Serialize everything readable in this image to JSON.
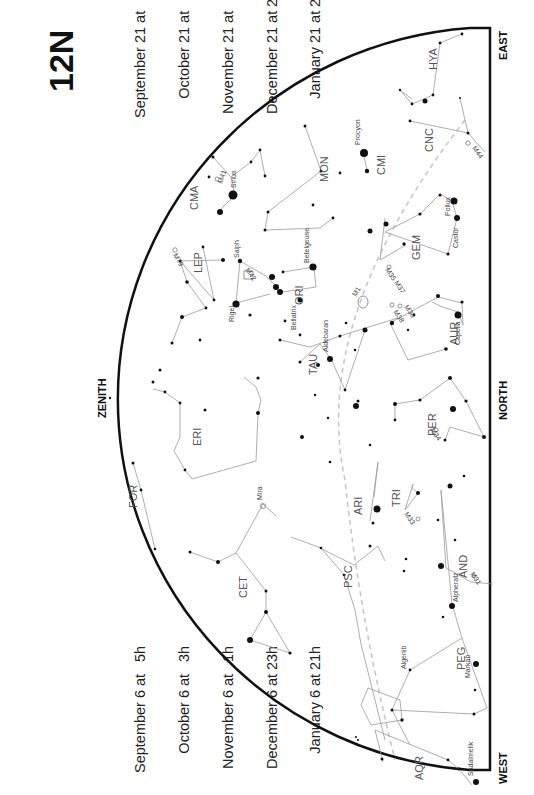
{
  "chart": {
    "id": "12N",
    "directions": {
      "east": "EAST",
      "north": "NORTH",
      "west": "WEST",
      "zenith": "ZENITH"
    }
  },
  "times_top": [
    {
      "date": "September 21",
      "at": "at",
      "hour": "4h"
    },
    {
      "date": "October 21",
      "at": "at",
      "hour": "2h"
    },
    {
      "date": "November 21",
      "at": "at",
      "hour": "0h"
    },
    {
      "date": "December 21",
      "at": "at",
      "hour": "22h"
    },
    {
      "date": "January 21",
      "at": "at",
      "hour": "20h"
    }
  ],
  "times_bottom": [
    {
      "date": "September 6",
      "at": "at",
      "hour": "5h"
    },
    {
      "date": "October 6",
      "at": "at",
      "hour": "3h"
    },
    {
      "date": "November 6",
      "at": "at",
      "hour": "1h"
    },
    {
      "date": "December 6",
      "at": "at",
      "hour": "23h"
    },
    {
      "date": "January 6",
      "at": "at",
      "hour": "21h"
    }
  ],
  "constellations": {
    "hya": "HYA",
    "cnc": "CNC",
    "cmi": "CMI",
    "mon": "MON",
    "cma": "CMA",
    "gem": "GEM",
    "lep": "LEP",
    "ori": "ORI",
    "aur": "AUR",
    "tau": "TAU",
    "per": "PER",
    "eri": "ERI",
    "ari": "ARI",
    "tri": "TRI",
    "for": "FOR",
    "cet": "CET",
    "and": "AND",
    "psc": "PSC",
    "peg": "PEG",
    "aqr": "AQR"
  },
  "stars": {
    "procyon": "Procyon",
    "sirius": "Sirius",
    "pollux": "Pollux",
    "castor": "Castor",
    "betelgeuse": "Betelgeuse",
    "bellatrix": "Bellatrix",
    "rigel": "Rigel",
    "saiph": "Saiph",
    "aldebaran": "Aldebaran",
    "capella": "Capella",
    "mira": "Mira",
    "alpheratz": "Alpheratz",
    "algenib": "Algenib",
    "markab": "Markab",
    "sadalmelik": "Sadalmelik"
  },
  "objects": {
    "m44": "M44",
    "m41": "M41",
    "m42": "M42",
    "m79": "M79",
    "m1": "M1",
    "m35": "M35 M37",
    "m36": "M36",
    "m38": "M38",
    "m34": "M34",
    "m33": "M33",
    "m31": "M31"
  },
  "colors": {
    "line": "#999999",
    "horizon": "#111111",
    "ecliptic": "#c8c8c8",
    "star": "#111111"
  }
}
